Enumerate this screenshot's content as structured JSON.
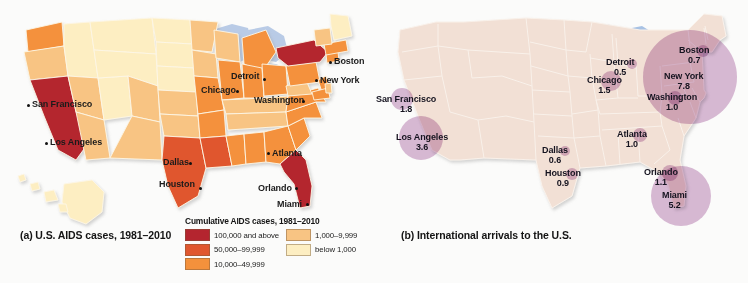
{
  "figure": {
    "background_color": "#fbfbfa"
  },
  "panel_a": {
    "caption": "(a) U.S. AIDS cases, 1981–2010",
    "legend": {
      "title": "Cumulative AIDS cases, 1981–2010",
      "column_left": [
        {
          "label": "100,000 and above",
          "color": "#b4252f"
        },
        {
          "label": "50,000–99,999",
          "color": "#e0572f"
        },
        {
          "label": "10,000–49,999",
          "color": "#f4913c"
        }
      ],
      "column_right": [
        {
          "label": "1,000–9,999",
          "color": "#f8c483"
        },
        {
          "label": "below 1,000",
          "color": "#fdeec2"
        }
      ]
    },
    "cities": [
      {
        "name": "San Francisco",
        "x": 32,
        "y": 100,
        "dot_x": 27,
        "dot_y": 104,
        "align": "left"
      },
      {
        "name": "Los Angeles",
        "x": 50,
        "y": 138,
        "dot_x": 45,
        "dot_y": 142,
        "align": "left"
      },
      {
        "name": "Dallas",
        "x": 163,
        "y": 158,
        "dot_x": 189,
        "dot_y": 162,
        "align": "left"
      },
      {
        "name": "Houston",
        "x": 159,
        "y": 180,
        "dot_x": 199,
        "dot_y": 187,
        "align": "left"
      },
      {
        "name": "Chicago",
        "x": 201,
        "y": 86,
        "dot_x": 236,
        "dot_y": 90,
        "align": "left"
      },
      {
        "name": "Detroit",
        "x": 231,
        "y": 72,
        "dot_x": 263,
        "dot_y": 78,
        "align": "left"
      },
      {
        "name": "Washington",
        "x": 254,
        "y": 96,
        "dot_x": 302,
        "dot_y": 100,
        "align": "left"
      },
      {
        "name": "Atlanta",
        "x": 272,
        "y": 149,
        "dot_x": 267,
        "dot_y": 152,
        "align": "left"
      },
      {
        "name": "Orlando",
        "x": 258,
        "y": 184,
        "dot_x": 295,
        "dot_y": 187,
        "align": "left"
      },
      {
        "name": "Miami",
        "x": 277,
        "y": 200,
        "dot_x": 306,
        "dot_y": 203,
        "align": "left"
      },
      {
        "name": "Boston",
        "x": 334,
        "y": 57,
        "dot_x": 329,
        "dot_y": 61,
        "align": "left"
      },
      {
        "name": "New York",
        "x": 320,
        "y": 76,
        "dot_x": 315,
        "dot_y": 79,
        "align": "left"
      }
    ]
  },
  "panel_b": {
    "caption": "(b) International arrivals to the U.S.",
    "bubble_color": "#a65ea0",
    "chart_data": {
      "type": "bubble-map",
      "title": "International arrivals to the U.S.",
      "unit": "millions of arrivals",
      "values": [
        {
          "city": "San Francisco",
          "value": 1.8
        },
        {
          "city": "Los Angeles",
          "value": 3.6
        },
        {
          "city": "Chicago",
          "value": 1.5
        },
        {
          "city": "Detroit",
          "value": 0.5
        },
        {
          "city": "Dallas",
          "value": 0.6
        },
        {
          "city": "Houston",
          "value": 0.9
        },
        {
          "city": "Atlanta",
          "value": 1.0
        },
        {
          "city": "Washington",
          "value": 1.0
        },
        {
          "city": "New York",
          "value": 7.8
        },
        {
          "city": "Boston",
          "value": 0.7
        },
        {
          "city": "Orlando",
          "value": 1.1
        },
        {
          "city": "Miami",
          "value": 5.2
        }
      ]
    },
    "markers": [
      {
        "city": "San Francisco",
        "value": "1.8",
        "lx": 2,
        "ly": 94,
        "bx": 28,
        "by": 99,
        "r": 11
      },
      {
        "city": "Los Angeles",
        "value": "3.6",
        "lx": 22,
        "ly": 132,
        "bx": 47,
        "by": 138,
        "r": 22
      },
      {
        "city": "Chicago",
        "value": "1.5",
        "lx": 213,
        "ly": 75,
        "bx": 237,
        "by": 81,
        "r": 10
      },
      {
        "city": "Detroit",
        "value": "0.5",
        "lx": 232,
        "ly": 57,
        "bx": 258,
        "by": 64,
        "r": 5
      },
      {
        "city": "Dallas",
        "value": "0.6",
        "lx": 168,
        "ly": 145,
        "bx": 191,
        "by": 151,
        "r": 5
      },
      {
        "city": "Houston",
        "value": "0.9",
        "lx": 171,
        "ly": 168,
        "bx": 198,
        "by": 174,
        "r": 6
      },
      {
        "city": "Atlanta",
        "value": "1.0",
        "lx": 243,
        "ly": 129,
        "bx": 266,
        "by": 135,
        "r": 7
      },
      {
        "city": "Washington",
        "value": "1.0",
        "lx": 273,
        "ly": 92,
        "bx": 301,
        "by": 98,
        "r": 7
      },
      {
        "city": "New York",
        "value": "7.8",
        "lx": 290,
        "ly": 71,
        "bx": 316,
        "by": 77,
        "r": 47
      },
      {
        "city": "Boston",
        "value": "0.7",
        "lx": 305,
        "ly": 45,
        "bx": 329,
        "by": 51,
        "r": 6
      },
      {
        "city": "Orlando",
        "value": "1.1",
        "lx": 270,
        "ly": 167,
        "bx": 296,
        "by": 173,
        "r": 8
      },
      {
        "city": "Miami",
        "value": "5.2",
        "lx": 288,
        "ly": 190,
        "bx": 307,
        "by": 196,
        "r": 30
      }
    ]
  }
}
